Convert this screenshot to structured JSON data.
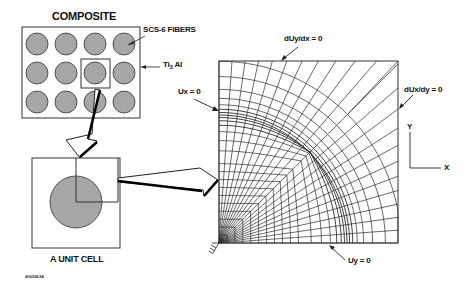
{
  "composite": {
    "title": "COMPOSITE",
    "fiber_label": "SCS-6 FIBERS",
    "matrix_label_main": "Ti",
    "matrix_label_sub": "3",
    "matrix_label_tail": " Al",
    "fiber_grid": {
      "rows": 3,
      "cols": 4,
      "fill": "#a6a6a6"
    }
  },
  "unit_cell": {
    "label": "A UNIT CELL"
  },
  "mesh": {
    "top_bc": "dUy/dx = 0",
    "right_bc": "dUx/dy = 0",
    "left_bc": "Ux = 0",
    "bottom_bc": "Uy = 0"
  },
  "axes": {
    "y_label": "Y",
    "x_label": "X"
  },
  "figure_id": "4G0294-8A",
  "colors": {
    "line": "#222222",
    "fiber_fill": "#a6a6a6",
    "background": "#ffffff"
  }
}
